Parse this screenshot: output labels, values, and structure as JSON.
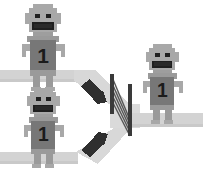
{
  "scene": {
    "title": "Two queues merging through a gate",
    "width": 203,
    "height": 175,
    "background": "#ffffff"
  },
  "palette": {
    "path": "#d3d3d3",
    "path_edge": "#c4c4c4",
    "funnel": "#d8d8d8",
    "body_light": "#a8a8a8",
    "body_mid": "#9a9a9a",
    "torso": "#777777",
    "torso_dark": "#6e6e6e",
    "outline": "#8a8a8a",
    "dark": "#2b2b2b",
    "facefeature": "#1f1f1f",
    "gate_post": "#3a3a3a",
    "gate_bar": "#4a4a4a",
    "arrow_bar": "#2f2f2f",
    "number_color": "#1b1b1b"
  },
  "figures": [
    {
      "id": "figure-top-left",
      "label": "1",
      "position": "top-left",
      "x": 22,
      "y": 4,
      "scale": 1.0,
      "side": "before-gate"
    },
    {
      "id": "figure-bottom-left",
      "label": "1",
      "position": "bottom-left",
      "x": 24,
      "y": 88,
      "scale": 0.92,
      "side": "before-gate"
    },
    {
      "id": "figure-right",
      "label": "1",
      "position": "right",
      "x": 143,
      "y": 44,
      "scale": 0.92,
      "side": "after-gate"
    }
  ],
  "paths": [
    {
      "id": "path-top-lane",
      "orientation": "horizontal",
      "lane": "top"
    },
    {
      "id": "path-bottom-lane",
      "orientation": "horizontal",
      "lane": "bottom"
    },
    {
      "id": "path-merge-funnel",
      "orientation": "converging",
      "lane": "middle"
    },
    {
      "id": "path-exit-lane",
      "orientation": "horizontal",
      "lane": "exit"
    }
  ],
  "gate": {
    "id": "turnstile-gate",
    "post_count": 2,
    "bar_count": 5,
    "orientation": "vertical"
  },
  "arrows": [
    {
      "id": "arrow-top-merge",
      "direction": "down-right"
    },
    {
      "id": "arrow-bottom-merge",
      "direction": "up-right"
    }
  ]
}
